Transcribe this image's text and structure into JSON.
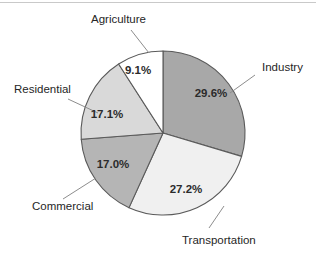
{
  "chart_data": {
    "type": "pie",
    "title": "",
    "subtitle": "",
    "xlabel": "",
    "ylabel": "",
    "legend_position": "none",
    "grid": false,
    "labels_placement": "outside-with-leader-lines",
    "value_labels_placement": "inside-slices",
    "start_angle_deg": 0,
    "direction": "clockwise",
    "units": "percent",
    "total": "100.0%",
    "categories": [
      "Industry",
      "Transportation",
      "Commercial",
      "Residential",
      "Agriculture"
    ],
    "values": [
      29.6,
      27.2,
      17.0,
      17.1,
      9.1
    ],
    "value_labels": [
      "29.6%",
      "27.2%",
      "17.0%",
      "17.1%",
      "9.1%"
    ],
    "colors": [
      "#a8a8a8",
      "#f0f0f0",
      "#b5b5b5",
      "#d9d9d9",
      "#ffffff"
    ],
    "slices": [
      {
        "name": "Industry",
        "value": 29.6,
        "value_label": "29.6%",
        "color": "#a8a8a8",
        "start_deg": 0.0,
        "end_deg": 106.56,
        "label_x": 262,
        "label_y": 71,
        "label_anchor": "start",
        "pct_x": 211,
        "pct_y": 97,
        "leader": "M 255 75 L 230 93"
      },
      {
        "name": "Transportation",
        "value": 27.2,
        "value_label": "27.2%",
        "color": "#f0f0f0",
        "start_deg": 106.56,
        "end_deg": 204.48,
        "label_x": 182,
        "label_y": 244,
        "label_anchor": "start",
        "pct_x": 186,
        "pct_y": 193,
        "leader": "M 209 228 L 224 206"
      },
      {
        "name": "Commercial",
        "value": 17.0,
        "value_label": "17.0%",
        "color": "#b5b5b5",
        "start_deg": 204.48,
        "end_deg": 265.68,
        "label_x": 32,
        "label_y": 210,
        "label_anchor": "start",
        "pct_x": 113,
        "pct_y": 168,
        "leader": "M 63 199 L 96 178"
      },
      {
        "name": "Residential",
        "value": 17.1,
        "value_label": "17.1%",
        "color": "#d9d9d9",
        "start_deg": 265.68,
        "end_deg": 327.24,
        "label_x": 14,
        "label_y": 93,
        "label_anchor": "start",
        "pct_x": 107,
        "pct_y": 118,
        "leader": "M 68 99 L 98 113"
      },
      {
        "name": "Agriculture",
        "value": 9.1,
        "value_label": "9.1%",
        "color": "#ffffff",
        "start_deg": 327.24,
        "end_deg": 360.0,
        "label_x": 91,
        "label_y": 23,
        "label_anchor": "start",
        "pct_x": 138,
        "pct_y": 74,
        "leader": "M 131 30 L 149 53"
      }
    ],
    "geometry": {
      "center_x": 163,
      "center_y": 133,
      "radius": 82
    }
  }
}
